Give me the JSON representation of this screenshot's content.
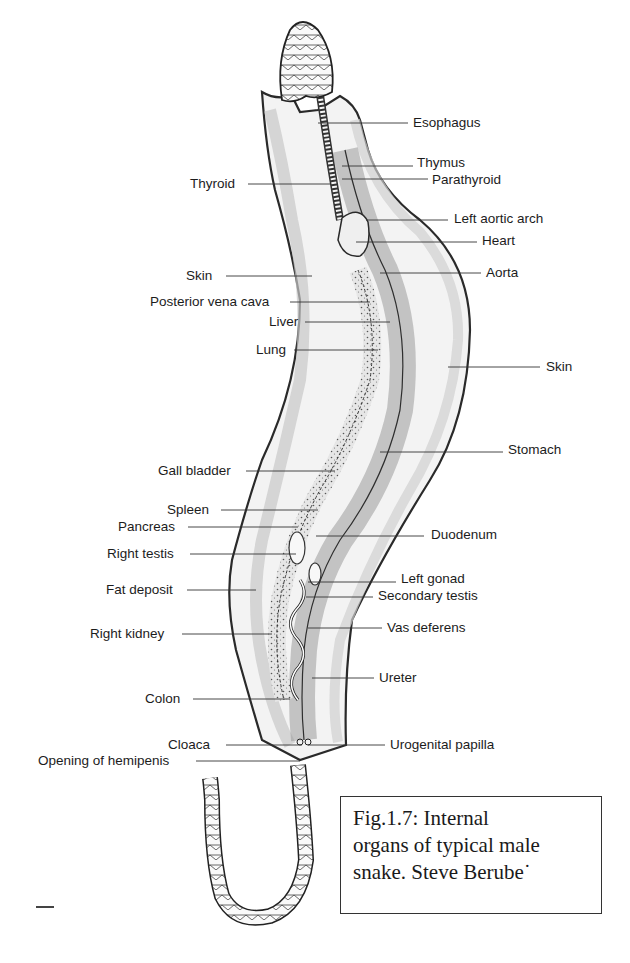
{
  "figure": {
    "title": "Internal organs of typical male snake",
    "caption_lines": [
      "Fig.1.7: Internal",
      "organs of typical male",
      "snake. Steve Berube˙"
    ],
    "colors": {
      "ink": "#1c1c1c",
      "shade": "#a9a9a9",
      "light_shade": "#d9d9d9",
      "paper": "#ffffff"
    }
  },
  "labels_left": [
    {
      "text": "Thyroid",
      "x": 190,
      "y": 176
    },
    {
      "text": "Skin",
      "x": 186,
      "y": 268
    },
    {
      "text": "Posterior vena cava",
      "x": 150,
      "y": 294
    },
    {
      "text": "Liver",
      "x": 269,
      "y": 314
    },
    {
      "text": "Lung",
      "x": 256,
      "y": 342
    },
    {
      "text": "Gall bladder",
      "x": 158,
      "y": 463
    },
    {
      "text": "Spleen",
      "x": 167,
      "y": 502
    },
    {
      "text": "Pancreas",
      "x": 118,
      "y": 519
    },
    {
      "text": "Right testis",
      "x": 107,
      "y": 546
    },
    {
      "text": "Fat deposit",
      "x": 106,
      "y": 582
    },
    {
      "text": "Right kidney",
      "x": 90,
      "y": 626
    },
    {
      "text": "Colon",
      "x": 145,
      "y": 691
    },
    {
      "text": "Cloaca",
      "x": 168,
      "y": 737
    },
    {
      "text": "Opening of hemipenis",
      "x": 38,
      "y": 755
    }
  ],
  "labels_right": [
    {
      "text": "Esophagus",
      "x": 413,
      "y": 115
    },
    {
      "text": "Thymus",
      "x": 417,
      "y": 155
    },
    {
      "text": "Parathyroid",
      "x": 432,
      "y": 173
    },
    {
      "text": "Left aortic arch",
      "x": 454,
      "y": 211
    },
    {
      "text": "Heart",
      "x": 482,
      "y": 233
    },
    {
      "text": "Aorta",
      "x": 486,
      "y": 265
    },
    {
      "text": "Skin",
      "x": 546,
      "y": 359
    },
    {
      "text": "Stomach",
      "x": 508,
      "y": 442
    },
    {
      "text": "Duodenum",
      "x": 431,
      "y": 527
    },
    {
      "text": "Left gonad",
      "x": 401,
      "y": 571
    },
    {
      "text": "Secondary testis",
      "x": 378,
      "y": 589
    },
    {
      "text": "Vas deferens",
      "x": 387,
      "y": 620
    },
    {
      "text": "Ureter",
      "x": 379,
      "y": 670
    },
    {
      "text": "Urogenital papilla",
      "x": 390,
      "y": 737
    }
  ]
}
